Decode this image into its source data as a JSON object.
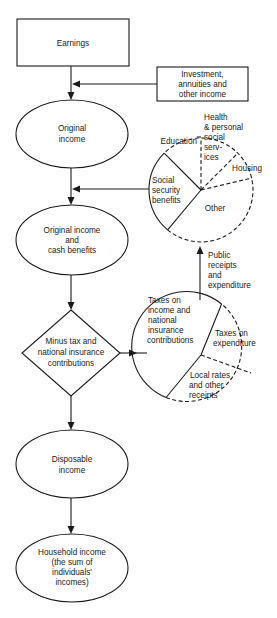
{
  "diagram": {
    "nodes": {
      "earnings": {
        "label": "Earnings",
        "shape": "rectangle"
      },
      "investment": {
        "lines": [
          "Investment,",
          "annuities and",
          "other income"
        ],
        "shape": "rectangle"
      },
      "original_income": {
        "lines": [
          "Original",
          "income"
        ],
        "shape": "ellipse"
      },
      "original_plus_benefits": {
        "lines": [
          "Original income",
          "and",
          "cash benefits"
        ],
        "shape": "ellipse"
      },
      "minus_tax": {
        "lines": [
          "Minus tax and",
          "national insurance",
          "contributions"
        ],
        "shape": "diamond"
      },
      "disposable_income": {
        "lines": [
          "Disposable",
          "income"
        ],
        "shape": "ellipse"
      },
      "household_income": {
        "lines": [
          "Household income",
          "(the sum of",
          "individuals'",
          "incomes)"
        ],
        "shape": "ellipse"
      }
    },
    "expenditure_pie": {
      "title": "Public expenditure",
      "segments": {
        "education": {
          "lines": [
            "Education"
          ]
        },
        "health": {
          "lines": [
            "Health",
            "& personal",
            "social",
            "serv-",
            "ices"
          ]
        },
        "housing": {
          "lines": [
            "Housing"
          ]
        },
        "social_security": {
          "lines": [
            "Social",
            "security",
            "benefits"
          ]
        },
        "other": {
          "lines": [
            "Other"
          ]
        }
      }
    },
    "connector_label": {
      "lines": [
        "Public",
        "receipts",
        "and",
        "expenditure"
      ]
    },
    "receipts_pie": {
      "title": "Public receipts",
      "segments": {
        "income_taxes": {
          "lines": [
            "Taxes on",
            "income and",
            "national",
            "insurance",
            "contributions"
          ]
        },
        "expenditure_taxes": {
          "lines": [
            "Taxes on",
            "expenditure"
          ]
        },
        "local_rates": {
          "lines": [
            "Local rates",
            "and other",
            "receipts"
          ]
        }
      }
    }
  }
}
